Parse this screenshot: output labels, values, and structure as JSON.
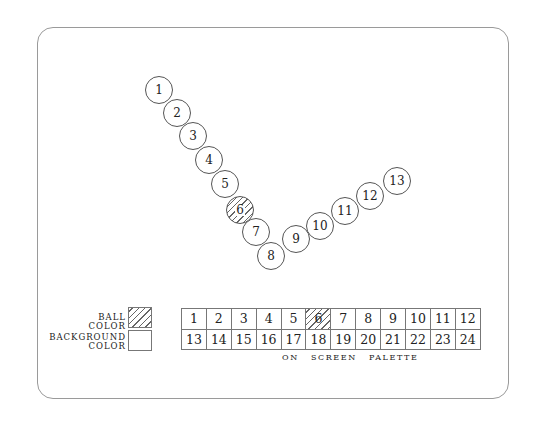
{
  "balls": [
    {
      "label": "1",
      "x": 159,
      "y": 90
    },
    {
      "label": "2",
      "x": 177,
      "y": 113
    },
    {
      "label": "3",
      "x": 193,
      "y": 136
    },
    {
      "label": "4",
      "x": 209,
      "y": 160
    },
    {
      "label": "5",
      "x": 225,
      "y": 184
    },
    {
      "label": "6",
      "x": 240,
      "y": 210,
      "pattern": "hatched"
    },
    {
      "label": "7",
      "x": 256,
      "y": 232
    },
    {
      "label": "8",
      "x": 271,
      "y": 256
    },
    {
      "label": "9",
      "x": 296,
      "y": 239
    },
    {
      "label": "10",
      "x": 320,
      "y": 226
    },
    {
      "label": "11",
      "x": 345,
      "y": 211
    },
    {
      "label": "12",
      "x": 370,
      "y": 196
    },
    {
      "label": "13",
      "x": 397,
      "y": 181
    }
  ],
  "swatches": {
    "ball_color": {
      "label_line1": "BALL",
      "label_line2": "COLOR",
      "pattern": "hatched"
    },
    "background_color": {
      "label_line1": "BACKGROUND",
      "label_line2": "COLOR",
      "pattern": "blank"
    }
  },
  "palette": {
    "cells": [
      "1",
      "2",
      "3",
      "4",
      "5",
      "6",
      "7",
      "8",
      "9",
      "10",
      "11",
      "12",
      "13",
      "14",
      "15",
      "16",
      "17",
      "18",
      "19",
      "20",
      "21",
      "22",
      "23",
      "24"
    ],
    "selected": "6",
    "caption": "ON SCREEN PALETTE"
  }
}
